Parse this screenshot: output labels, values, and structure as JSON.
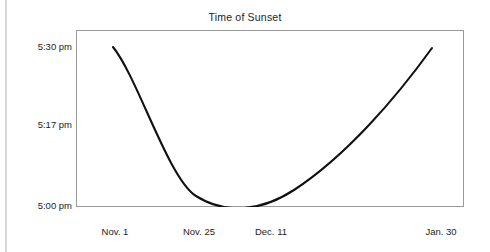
{
  "chart_data": {
    "type": "line",
    "title": "Time of Sunset",
    "xlabel": "",
    "ylabel": "",
    "grid": false,
    "legend": false,
    "x_tick_labels": [
      "Nov. 1",
      "Nov. 25",
      "Dec. 11",
      "Jan. 30"
    ],
    "y_tick_labels": [
      "5:30 pm",
      "5:17 pm",
      "5:00 pm"
    ],
    "ylim": [
      "5:00 pm",
      "5:30 pm"
    ],
    "xlim": [
      "Nov. 1",
      "Jan. 30"
    ],
    "series": [
      {
        "name": "Time of sunset",
        "x": [
          "Nov. 1",
          "Nov. 25",
          "Dec. 11",
          "Jan. 30"
        ],
        "y": [
          "5:17 pm",
          "5:01 pm",
          "5:01 pm",
          "5:30 pm"
        ],
        "points": [
          {
            "x": "Nov. 1",
            "y": "5:17 pm"
          },
          {
            "x": "Nov. 11",
            "y": "5:09 pm"
          },
          {
            "x": "Nov. 20",
            "y": "5:04 pm"
          },
          {
            "x": "Nov. 25",
            "y": "5:01 pm"
          },
          {
            "x": "Dec. 5",
            "y": "5:00 pm"
          },
          {
            "x": "Dec. 11",
            "y": "5:01 pm"
          },
          {
            "x": "Dec. 25",
            "y": "5:05 pm"
          },
          {
            "x": "Jan. 10",
            "y": "5:14 pm"
          },
          {
            "x": "Jan. 20",
            "y": "5:21 pm"
          },
          {
            "x": "Jan. 30",
            "y": "5:30 pm"
          }
        ],
        "color": "#111111"
      }
    ],
    "minimum": {
      "x": "Dec. 5",
      "y": "5:00 pm"
    }
  },
  "chart": {
    "title": "Time of Sunset",
    "y_ticks": [
      {
        "label": "5:30 pm",
        "top": 41
      },
      {
        "label": "5:17 pm",
        "top": 119
      },
      {
        "label": "5:00 pm",
        "top": 200
      }
    ],
    "x_ticks": [
      {
        "label": "Nov. 1",
        "left": 115,
        "top": 226
      },
      {
        "label": "Nov. 25",
        "left": 199,
        "top": 226
      },
      {
        "label": "Dec. 11",
        "left": 271,
        "top": 226
      },
      {
        "label": "Jan. 30",
        "left": 441,
        "top": 226
      }
    ],
    "curve_path": "M 37 17 C 62 48 92 148 120 166 C 150 185 186 181 218 160 C 270 126 320 68 356 18",
    "curve_color": "#111111",
    "frame_color": "#9a9a9a"
  }
}
